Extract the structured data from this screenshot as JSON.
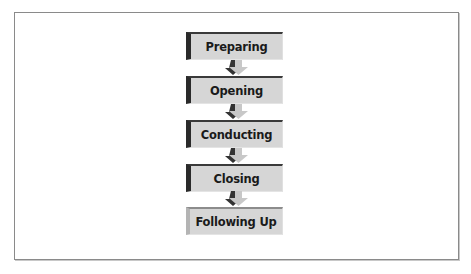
{
  "diagram": {
    "type": "vertical-process-flow",
    "steps": [
      {
        "label": "Preparing"
      },
      {
        "label": "Opening"
      },
      {
        "label": "Conducting"
      },
      {
        "label": "Closing"
      },
      {
        "label": "Following Up"
      }
    ],
    "colors": {
      "box_fill": "#d6d6d6",
      "box_accent": "#2a2a2a",
      "arrow_fill": "#c8c8c8",
      "arrow_shadow": "#333333",
      "frame_border": "#8a8a8a"
    }
  }
}
